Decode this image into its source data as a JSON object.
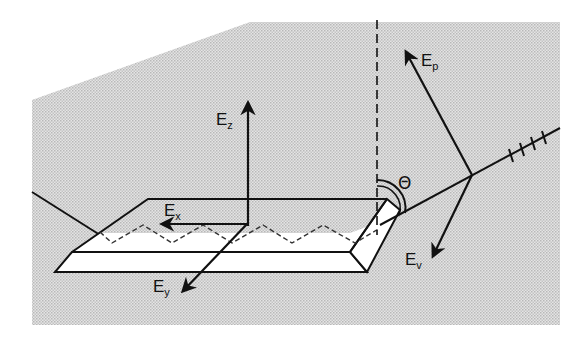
{
  "diagram": {
    "type": "optical-waveguide-polarization-schematic",
    "labels": {
      "ez": {
        "main": "E",
        "sub": "z"
      },
      "ex": {
        "main": "E",
        "sub": "x"
      },
      "ey": {
        "main": "E",
        "sub": "y"
      },
      "ep": {
        "main": "E",
        "sub": "p"
      },
      "ev": {
        "main": "E",
        "sub": "v"
      },
      "theta": "Θ"
    },
    "elements": [
      "shaded background plane",
      "beveled crystal slab (ATR element)",
      "zig-zag internal reflection path (dashed)",
      "vertical surface normal (dashed)",
      "incoming light beam (left)",
      "outgoing light beam with polarization ticks (right)",
      "field vector arrows Ex, Ey, Ez",
      "polarization vectors Ep, Ev",
      "incidence angle arc Θ"
    ],
    "colors": {
      "background": "#ffffff",
      "shade": "#d6d6d6",
      "stroke": "#111111",
      "crystal_fill": "#ffffff"
    }
  }
}
